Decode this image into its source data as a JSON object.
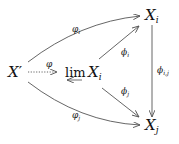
{
  "diagram": {
    "nodes": {
      "x_prime": {
        "base": "X",
        "sup": "′"
      },
      "lim": {
        "op": "lim",
        "base": "X",
        "sub": "i"
      },
      "x_i": {
        "base": "X",
        "sub": "i"
      },
      "x_j": {
        "base": "X",
        "sub": "j"
      }
    },
    "arrows": {
      "phi_i_curve": {
        "sym": "φ",
        "sub": "i",
        "from": "X′",
        "to": "X_i"
      },
      "phi_j_curve": {
        "sym": "φ",
        "sub": "j",
        "from": "X′",
        "to": "X_j"
      },
      "phi_dotted": {
        "sym": "φ",
        "from": "X′",
        "to": "lim X_i"
      },
      "proj_i": {
        "sym": "ϕ",
        "sub": "i",
        "from": "lim X_i",
        "to": "X_i"
      },
      "proj_j": {
        "sym": "ϕ",
        "sub": "j",
        "from": "lim X_i",
        "to": "X_j"
      },
      "trans_ij": {
        "sym": "ϕ",
        "sub": "i,j",
        "from": "X_i",
        "to": "X_j"
      }
    },
    "colors": {
      "ink": "#111111",
      "arrow": "#555555"
    }
  }
}
